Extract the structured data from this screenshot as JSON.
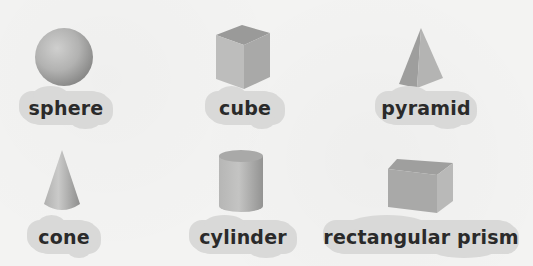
{
  "shapes": [
    {
      "id": "sphere",
      "label": "sphere"
    },
    {
      "id": "cube",
      "label": "cube"
    },
    {
      "id": "pyramid",
      "label": "pyramid"
    },
    {
      "id": "cone",
      "label": "cone"
    },
    {
      "id": "cylinder",
      "label": "cylinder"
    },
    {
      "id": "rectangular-prism",
      "label": "rectangular prism"
    }
  ],
  "colors": {
    "background": "#f3f3f2",
    "label_cloud": "#d9d9d8",
    "label_text": "#2a2a2a",
    "shape_light": "#c9c9c8",
    "shape_mid": "#a8a8a7",
    "shape_dark": "#8a8a89"
  }
}
